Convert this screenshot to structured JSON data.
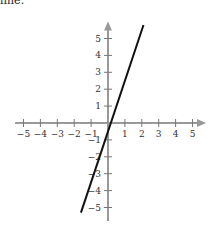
{
  "caption": "line.",
  "chart_data": {
    "type": "line",
    "title": "",
    "xlabel": "",
    "ylabel": "",
    "xlim": [
      -5.5,
      5.8
    ],
    "ylim": [
      -5.8,
      6.0
    ],
    "x_ticks": [
      -5,
      -4,
      -3,
      -2,
      -1,
      1,
      2,
      3,
      4,
      5
    ],
    "y_ticks": [
      -5,
      -4,
      -3,
      -2,
      -1,
      1,
      2,
      3,
      4,
      5
    ],
    "x_tick_labels": [
      "−5",
      "−4",
      "−3",
      "−2",
      "−1",
      "1",
      "2",
      "3",
      "4",
      "5"
    ],
    "y_tick_labels": [
      "−5",
      "−4",
      "−3",
      "−2",
      "−1",
      "1",
      "2",
      "3",
      "4",
      "5"
    ],
    "grid": false,
    "axis_color": "#999999",
    "line_color": "#111111",
    "series": [
      {
        "name": "line",
        "x": [
          -1.6,
          2.1
        ],
        "y": [
          -5.3,
          5.8
        ]
      }
    ]
  }
}
